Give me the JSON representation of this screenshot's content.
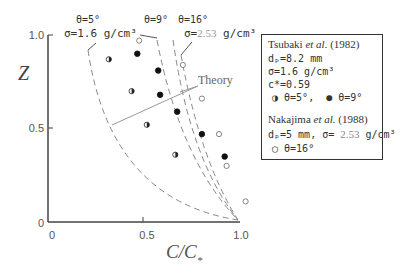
{
  "chart_data": {
    "type": "scatter",
    "title": "",
    "xlabel": "C/C*",
    "ylabel": "Z",
    "xlim": [
      0,
      1.0
    ],
    "ylim": [
      0,
      1.0
    ],
    "x_ticks": [
      "0",
      "0.5",
      "1.0"
    ],
    "y_ticks": [
      "0",
      "0.5",
      "1.0"
    ],
    "grid": false,
    "legend_position": "right",
    "series": [
      {
        "name": "θ=5° (Tsubaki et al. 1982)",
        "marker": "half-filled-circle",
        "points": [
          [
            0.32,
            0.87
          ],
          [
            0.44,
            0.7
          ],
          [
            0.52,
            0.52
          ],
          [
            0.67,
            0.36
          ]
        ]
      },
      {
        "name": "θ=9° (Tsubaki et al. 1982)",
        "marker": "filled-circle",
        "points": [
          [
            0.47,
            0.9
          ],
          [
            0.58,
            0.81
          ],
          [
            0.59,
            0.68
          ],
          [
            0.68,
            0.59
          ],
          [
            0.81,
            0.47
          ],
          [
            0.93,
            0.35
          ]
        ]
      },
      {
        "name": "θ=16° (Nakajima et al. 1988)",
        "marker": "open-circle",
        "points": [
          [
            0.48,
            0.97
          ],
          [
            0.71,
            0.84
          ],
          [
            0.81,
            0.66
          ],
          [
            0.9,
            0.47
          ],
          [
            0.94,
            0.3
          ],
          [
            1.04,
            0.11
          ]
        ]
      }
    ],
    "theory_curves": [
      {
        "label": "θ=5°, σ=1.6 g/cm³"
      },
      {
        "label": "θ=9°"
      },
      {
        "label": "θ=16°, σ=2.53 g/cm³"
      }
    ],
    "annotations": {
      "theta5": "θ=5°",
      "sigma16": "σ=1.6 g/cm³",
      "theta9": "θ=9°",
      "theta16": "θ=16°",
      "sigma253_prefix": "σ=",
      "sigma253_value": "2.53",
      "sigma253_unit": " g/cm³",
      "theory": "Theory"
    },
    "legend": {
      "tsubaki_author": "Tsubaki ",
      "et_al": "et al.",
      "tsubaki_year": " (1982)",
      "tsubaki_dp": "dₚ=8.2 mm",
      "tsubaki_sigma": "σ=1.6 g/cm³",
      "tsubaki_cstar": "c*=0.59",
      "tsubaki_markers_5": "θ=5°,",
      "tsubaki_markers_9": "θ=9°",
      "nakajima_author": "Nakajima ",
      "nakajima_year": " (1988)",
      "nakajima_dp": "dₚ=5 mm, σ= ",
      "nakajima_sigma_val": "2.53",
      "nakajima_sigma_unit": " g/cm³",
      "nakajima_marker": "θ=16°"
    }
  }
}
